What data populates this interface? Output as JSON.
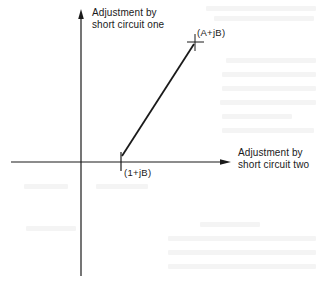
{
  "diagram": {
    "type": "phasor-adjustment-plot",
    "axes": {
      "vertical": {
        "label_line1": "Adjustment by",
        "label_line2": "short circuit one"
      },
      "horizontal": {
        "label_line1": "Adjustment by",
        "label_line2": "short circuit two"
      }
    },
    "points": {
      "start": {
        "label": "(1+jB)",
        "marker": "vertical-tick"
      },
      "end": {
        "label": "(A+jB)",
        "marker": "cross"
      }
    },
    "path": {
      "from": "(1+jB)",
      "to": "(A+jB)",
      "style": "straight-line"
    },
    "colors": {
      "ink": "#1a1a1a",
      "background": "#ffffff"
    }
  }
}
